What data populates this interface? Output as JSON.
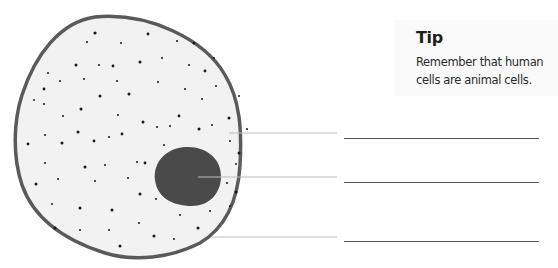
{
  "tip": {
    "title": "Tip",
    "body": "Remember that human cells are animal cells."
  },
  "diagram": {
    "cell_fill": "#f2f2f2",
    "membrane_color": "#5a5a5a",
    "nucleus_color": "#4a4a4a",
    "dot_color": "#1a1a1a",
    "leader_color": "#bdbdbd",
    "answer_line_color": "#555555",
    "labels": [
      {
        "target": "cytoplasm",
        "text": ""
      },
      {
        "target": "nucleus",
        "text": ""
      },
      {
        "target": "cell-membrane",
        "text": ""
      }
    ]
  }
}
